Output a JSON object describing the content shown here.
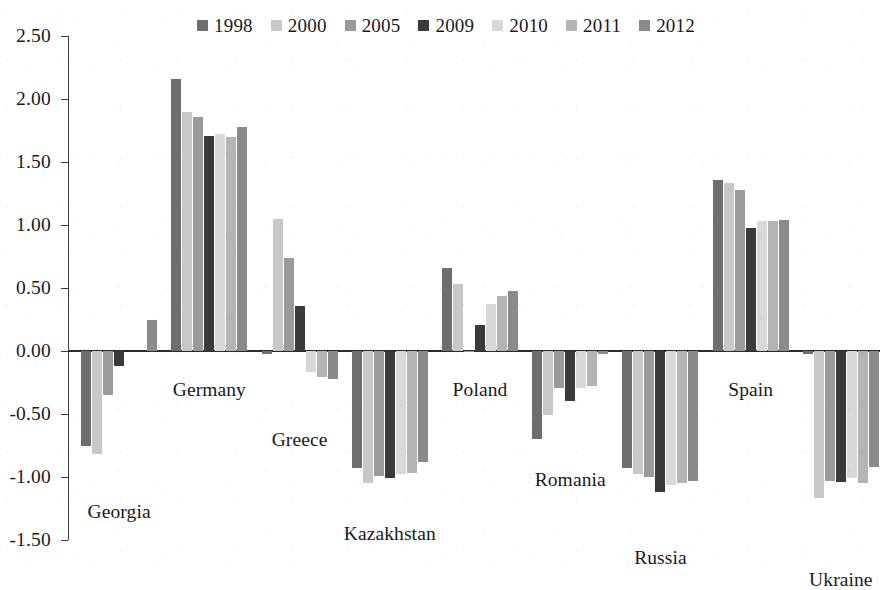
{
  "chart_data": {
    "type": "bar",
    "title": "",
    "subtitle": "",
    "xlabel": "",
    "ylabel": "",
    "ylim": [
      -1.5,
      2.5
    ],
    "ytick_step": 0.5,
    "ytick_labels": [
      "2.50",
      "2.00",
      "1.50",
      "1.00",
      "0.50",
      "0.00",
      "-0.50",
      "-1.00",
      "-1.50"
    ],
    "ytick_values": [
      2.5,
      2.0,
      1.5,
      1.0,
      0.5,
      0.0,
      -0.5,
      -1.0,
      -1.5
    ],
    "grid": false,
    "legend_position": "top-center",
    "orientation": "vertical",
    "categories": [
      "Georgia",
      "Germany",
      "Greece",
      "Kazakhstan",
      "Poland",
      "Romania",
      "Russia",
      "Spain",
      "Ukraine"
    ],
    "series": [
      {
        "name": "1998",
        "color": "#6e6e6e",
        "values": [
          -0.75,
          2.16,
          -0.02,
          -0.93,
          0.66,
          -0.7,
          -0.93,
          1.36,
          -0.02
        ]
      },
      {
        "name": "2000",
        "color": "#c8c8c8",
        "values": [
          -0.82,
          1.9,
          1.05,
          -1.05,
          0.53,
          -0.51,
          -0.98,
          1.33,
          -1.17
        ]
      },
      {
        "name": "2005",
        "color": "#9a9a9a",
        "values": [
          -0.35,
          1.86,
          0.74,
          -0.99,
          -0.01,
          -0.29,
          -1.0,
          1.28,
          -1.03
        ]
      },
      {
        "name": "2009",
        "color": "#3a3a3a",
        "values": [
          -0.12,
          1.71,
          0.36,
          -1.01,
          0.21,
          -0.4,
          -1.12,
          0.98,
          -1.04
        ]
      },
      {
        "name": "2010",
        "color": "#d8d8d8",
        "values": [
          0.0,
          1.72,
          -0.17,
          -0.98,
          0.37,
          -0.29,
          -1.06,
          1.03,
          -1.01
        ]
      },
      {
        "name": "2011",
        "color": "#b4b4b4",
        "values": [
          0.0,
          1.7,
          -0.21,
          -0.97,
          0.44,
          -0.28,
          -1.05,
          1.03,
          -1.05
        ]
      },
      {
        "name": "2012",
        "color": "#8a8a8a",
        "values": [
          0.25,
          1.78,
          -0.22,
          -0.88,
          0.48,
          -0.02,
          -1.03,
          1.04,
          -0.92
        ]
      }
    ],
    "category_label_offsets_px": [
      {
        "name": "Georgia",
        "dy": 150
      },
      {
        "name": "Germany",
        "dy": 28
      },
      {
        "name": "Greece",
        "dy": 78
      },
      {
        "name": "Kazakhstan",
        "dy": 172
      },
      {
        "name": "Poland",
        "dy": 28
      },
      {
        "name": "Romania",
        "dy": 118
      },
      {
        "name": "Russia",
        "dy": 196
      },
      {
        "name": "Spain",
        "dy": 28
      },
      {
        "name": "Ukraine",
        "dy": 218
      }
    ]
  },
  "legend": {
    "items": [
      {
        "label": "1998"
      },
      {
        "label": "2000"
      },
      {
        "label": "2005"
      },
      {
        "label": "2009"
      },
      {
        "label": "2010"
      },
      {
        "label": "2011"
      },
      {
        "label": "2012"
      }
    ]
  }
}
